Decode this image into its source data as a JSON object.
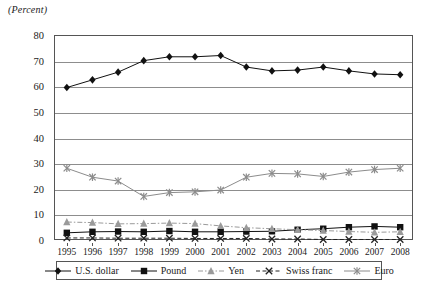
{
  "unit_label": "(Percent)",
  "chart_data": {
    "type": "line",
    "title": "",
    "subtitle": "",
    "xlabel": "",
    "ylabel": "(Percent)",
    "ylim": [
      0,
      80
    ],
    "yticks": [
      0,
      10,
      20,
      30,
      40,
      50,
      60,
      70,
      80
    ],
    "grid": true,
    "legend_position": "bottom",
    "categories": [
      1995,
      1996,
      1997,
      1998,
      1999,
      2000,
      2001,
      2002,
      2003,
      2004,
      2005,
      2006,
      2007,
      2008
    ],
    "x": [
      "1995",
      "1996",
      "1997",
      "1998",
      "1999",
      "2000",
      "2001",
      "2002",
      "2003",
      "2004",
      "2005",
      "2006",
      "2007",
      "2008"
    ],
    "series": [
      {
        "name": "U.S. dollar",
        "marker": "diamond",
        "color": "#111111",
        "dash": "none",
        "values": [
          59.5,
          62.5,
          65.5,
          70.0,
          71.5,
          71.5,
          72.0,
          67.5,
          66.0,
          66.3,
          67.5,
          66.0,
          64.8,
          64.5
        ]
      },
      {
        "name": "Pound",
        "marker": "square",
        "color": "#111111",
        "dash": "none",
        "values": [
          2.8,
          3.2,
          3.3,
          3.2,
          3.5,
          3.2,
          3.2,
          3.3,
          3.4,
          4.0,
          4.4,
          5.0,
          5.3,
          5.0
        ]
      },
      {
        "name": "Yen",
        "marker": "triangle",
        "color": "#9a9a9a",
        "dash": "dashdot",
        "values": [
          7.0,
          6.8,
          6.3,
          6.4,
          6.6,
          6.4,
          5.5,
          4.8,
          4.4,
          4.0,
          3.7,
          3.3,
          3.0,
          3.2
        ]
      },
      {
        "name": "Swiss franc",
        "marker": "x",
        "color": "#222222",
        "dash": "dash",
        "values": [
          0.8,
          0.8,
          0.7,
          0.7,
          0.7,
          0.6,
          0.6,
          0.6,
          0.4,
          0.4,
          0.2,
          0.2,
          0.2,
          0.2
        ]
      },
      {
        "name": "Euro",
        "marker": "asterisk",
        "color": "#8c8c8c",
        "dash": "none",
        "values": [
          28.0,
          24.5,
          23.0,
          17.0,
          18.5,
          18.8,
          19.5,
          24.5,
          26.0,
          25.8,
          24.8,
          26.5,
          27.5,
          28.0
        ]
      }
    ]
  },
  "legend": {
    "entries": [
      {
        "label": "U.S. dollar"
      },
      {
        "label": "Pound"
      },
      {
        "label": "Yen"
      },
      {
        "label": "Swiss franc"
      },
      {
        "label": "Euro"
      }
    ]
  }
}
